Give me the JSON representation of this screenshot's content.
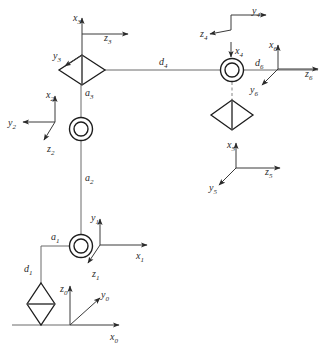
{
  "diagram": {
    "type": "kinematic-skeleton",
    "width": 326,
    "height": 350,
    "colors": {
      "background": "#ffffff",
      "link": "#6b6b6b",
      "joint_stroke": "#1d1d1d",
      "axis": "#3a3a3a",
      "label": "#2a2a2a",
      "dashed_link": "#9a9a9a"
    }
  },
  "frames": [
    {
      "id": "frame-0",
      "name": "frame-0",
      "origin": [
        70,
        325
      ],
      "axes": [
        {
          "name": "z0-axis",
          "label": "z",
          "sub": "0",
          "dir": "up",
          "label_x": 64,
          "label_y": 290,
          "tip": [
            70,
            284
          ]
        },
        {
          "name": "y0-axis",
          "label": "y",
          "sub": "0",
          "dir": "diag-up-right",
          "label_x": 104,
          "label_y": 299,
          "tip": [
            101,
            299
          ]
        },
        {
          "name": "x0-axis",
          "label": "x",
          "sub": "0",
          "dir": "right",
          "label_x": 114,
          "label_y": 340,
          "tip": [
            119,
            325
          ]
        }
      ]
    },
    {
      "id": "frame-1",
      "name": "frame-1",
      "origin": [
        100,
        245
      ],
      "axes": [
        {
          "name": "y1-axis",
          "label": "y",
          "sub": "1",
          "dir": "up",
          "label_x": 94,
          "label_y": 222,
          "tip": [
            100,
            217
          ]
        },
        {
          "name": "x1-axis",
          "label": "x",
          "sub": "1",
          "dir": "right",
          "label_x": 136,
          "label_y": 259,
          "tip": [
            147,
            245
          ]
        },
        {
          "name": "z1-axis",
          "label": "z",
          "sub": "1",
          "dir": "diag-down-right",
          "label_x": 95,
          "label_y": 277,
          "tip": [
            89,
            262
          ]
        }
      ]
    },
    {
      "id": "frame-2",
      "name": "frame-2",
      "origin": [
        55,
        122
      ],
      "axes": [
        {
          "name": "x2-axis",
          "label": "x",
          "sub": "2",
          "dir": "up",
          "label_x": 49,
          "label_y": 99,
          "tip": [
            55,
            94
          ]
        },
        {
          "name": "y2-axis",
          "label": "y",
          "sub": "2",
          "dir": "left",
          "label_x": 9,
          "label_y": 126,
          "tip": [
            23,
            122
          ]
        },
        {
          "name": "z2-axis",
          "label": "z",
          "sub": "2",
          "dir": "diag-down-right",
          "label_x": 50,
          "label_y": 152,
          "tip": [
            45,
            140
          ]
        }
      ]
    },
    {
      "id": "frame-3",
      "name": "frame-3",
      "origin": [
        82,
        55
      ],
      "axes": [
        {
          "name": "x3-axis",
          "label": "x",
          "sub": "3",
          "dir": "up",
          "label_x": 76,
          "label_y": 22,
          "tip": [
            82,
            16
          ]
        },
        {
          "name": "z3-axis",
          "label": "z",
          "sub": "3",
          "dir": "right",
          "label_x": 103,
          "label_y": 40,
          "tip": [
            128,
            34
          ]
        },
        {
          "name": "y3-axis",
          "label": "y",
          "sub": "3",
          "dir": "diag-down-left",
          "label_x": 54,
          "label_y": 59,
          "tip": [
            66,
            66
          ]
        }
      ]
    },
    {
      "id": "frame-4",
      "name": "frame-4",
      "origin": [
        231,
        27
      ],
      "axes": [
        {
          "name": "y4-axis",
          "label": "y",
          "sub": "4",
          "dir": "right",
          "label_x": 252,
          "label_y": 15,
          "tip": [
            266,
            15
          ]
        },
        {
          "name": "z4-axis",
          "label": "z",
          "sub": "4",
          "dir": "diag-up-left",
          "label_x": 203,
          "label_y": 38,
          "tip": [
            209,
            33
          ]
        },
        {
          "name": "x4-axis",
          "label": "x",
          "sub": "4",
          "dir": "down",
          "label_x": 236,
          "label_y": 54,
          "tip": [
            231,
            58
          ]
        }
      ]
    },
    {
      "id": "frame-5",
      "name": "frame-5",
      "origin": [
        236,
        168
      ],
      "axes": [
        {
          "name": "x5-axis",
          "label": "x",
          "sub": "5",
          "dir": "up",
          "label_x": 230,
          "label_y": 148,
          "tip": [
            236,
            141
          ]
        },
        {
          "name": "z5-axis",
          "label": "z",
          "sub": "5",
          "dir": "right",
          "label_x": 264,
          "label_y": 174,
          "tip": [
            280,
            168
          ]
        },
        {
          "name": "y5-axis",
          "label": "y",
          "sub": "5",
          "dir": "diag-down-left",
          "label_x": 210,
          "label_y": 190,
          "tip": [
            219,
            185
          ]
        }
      ]
    },
    {
      "id": "frame-6",
      "name": "frame-6",
      "origin": [
        278,
        69
      ],
      "axes": [
        {
          "name": "x6-axis",
          "label": "x",
          "sub": "6",
          "dir": "up",
          "label_x": 272,
          "label_y": 49,
          "tip": [
            278,
            44
          ]
        },
        {
          "name": "z6-axis",
          "label": "z",
          "sub": "6",
          "dir": "right",
          "label_x": 306,
          "label_y": 76,
          "tip": [
            318,
            69
          ]
        },
        {
          "name": "y6-axis",
          "label": "y",
          "sub": "6",
          "dir": "diag-down-left",
          "label_x": 252,
          "label_y": 92,
          "tip": [
            261,
            86
          ]
        }
      ]
    }
  ],
  "joints": [
    {
      "id": "joint-1",
      "name": "revolute-joint-1",
      "type": "revolute",
      "shape": "double-circle",
      "cx": 81,
      "cy": 246,
      "r_outer": 11.5,
      "r_inner": 7
    },
    {
      "id": "joint-2",
      "name": "revolute-joint-2",
      "type": "revolute",
      "shape": "double-circle",
      "cx": 81,
      "cy": 129,
      "r_outer": 11.5,
      "r_inner": 7
    },
    {
      "id": "joint-3",
      "name": "prismatic-joint-3",
      "type": "prismatic",
      "shape": "diamond-horizontal",
      "cx": 82,
      "cy": 70,
      "rx": 23,
      "ry": 15
    },
    {
      "id": "joint-4",
      "name": "revolute-joint-4",
      "type": "revolute",
      "shape": "double-circle",
      "cx": 232,
      "cy": 70,
      "r_outer": 11.5,
      "r_inner": 7
    },
    {
      "id": "joint-5",
      "name": "prismatic-joint-5",
      "type": "prismatic",
      "shape": "diamond-horizontal",
      "cx": 232,
      "cy": 115,
      "rx": 21,
      "ry": 15
    },
    {
      "id": "joint-base",
      "name": "prismatic-joint-base",
      "type": "prismatic",
      "shape": "diamond-vertical",
      "cx": 41,
      "cy": 304,
      "rx": 14,
      "ry": 21
    }
  ],
  "link_labels": [
    {
      "id": "label-d1",
      "name": "link-label-d1",
      "label": "d",
      "sub": "1",
      "x": 25,
      "y": 271
    },
    {
      "id": "label-a1",
      "name": "link-label-a1",
      "label": "a",
      "sub": "1",
      "x": 52,
      "y": 239
    },
    {
      "id": "label-a2",
      "name": "link-label-a2",
      "label": "a",
      "sub": "2",
      "x": 86,
      "y": 180
    },
    {
      "id": "label-a3",
      "name": "link-label-a3",
      "label": "a",
      "sub": "3",
      "x": 86,
      "y": 95
    },
    {
      "id": "label-d4",
      "name": "link-label-d4",
      "label": "d",
      "sub": "4",
      "x": 160,
      "y": 64
    },
    {
      "id": "label-d6",
      "name": "link-label-d6",
      "label": "d",
      "sub": "6",
      "x": 257,
      "y": 66
    }
  ],
  "links": [
    {
      "id": "link-ground",
      "name": "ground-line",
      "from": [
        12,
        325
      ],
      "to": [
        70,
        325
      ]
    },
    {
      "id": "link-d1",
      "name": "link-segment-d1",
      "from": [
        41,
        290
      ],
      "to": [
        41,
        246
      ]
    },
    {
      "id": "link-a1",
      "name": "link-segment-a1",
      "from": [
        41,
        246
      ],
      "to": [
        81,
        246
      ]
    },
    {
      "id": "link-a2",
      "name": "link-segment-a2",
      "from": [
        81,
        246
      ],
      "to": [
        81,
        129
      ]
    },
    {
      "id": "link-a3",
      "name": "link-segment-a3",
      "from": [
        81,
        129
      ],
      "to": [
        81,
        85
      ]
    },
    {
      "id": "link-d4",
      "name": "link-segment-d4",
      "from": [
        105,
        70
      ],
      "to": [
        221,
        70
      ]
    },
    {
      "id": "link-d6",
      "name": "link-segment-d6",
      "from": [
        243,
        70
      ],
      "to": [
        318,
        70
      ]
    },
    {
      "id": "link-j4-j5",
      "name": "link-segment-j4-j5",
      "from": [
        232,
        82
      ],
      "to": [
        232,
        101
      ],
      "dashed": true
    }
  ]
}
